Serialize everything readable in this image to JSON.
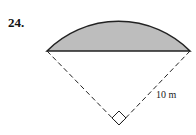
{
  "problem_number": "24.",
  "figure": {
    "radius_label": "10 m",
    "central_angle_deg": 90,
    "shaded_region": "segment",
    "shade_color": "#bdbdbd",
    "line_color": "#222222"
  }
}
